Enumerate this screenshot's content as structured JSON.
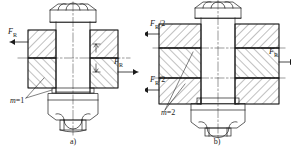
{
  "figure": {
    "type": "engineering-line-drawing",
    "background_color": "#ffffff",
    "line_color": "#1a1a1a"
  },
  "panels": [
    {
      "id": "a",
      "caption": "a)",
      "shear_planes": 2,
      "interface_label": {
        "symbol": "m",
        "equals": "=",
        "value": "1",
        "text": "m=1"
      },
      "force_labels": [
        {
          "id": "left-force",
          "symbol": "F",
          "subscript": "R",
          "text": "F_R",
          "direction": "left",
          "position": "upper-left"
        },
        {
          "id": "right-force",
          "symbol": "F",
          "subscript": "R",
          "text": "F_R",
          "direction": "right",
          "position": "middle-right"
        }
      ],
      "parts": [
        "hex-bolt-head",
        "bolt-shank",
        "upper-plate",
        "lower-plate",
        "washer",
        "hex-nut",
        "thread-end"
      ]
    },
    {
      "id": "b",
      "caption": "b)",
      "shear_planes": 3,
      "interface_label": {
        "symbol": "m",
        "equals": "=",
        "value": "2",
        "text": "m=2"
      },
      "force_labels": [
        {
          "id": "left-force-upper",
          "symbol": "F",
          "subscript": "R",
          "divisor": "/2",
          "text": "F_R/2",
          "direction": "left",
          "position": "upper-left"
        },
        {
          "id": "left-force-lower",
          "symbol": "F",
          "subscript": "R",
          "divisor": "/2",
          "text": "F_R/2",
          "direction": "left",
          "position": "lower-left"
        },
        {
          "id": "right-force",
          "symbol": "F",
          "subscript": "R",
          "text": "F_R",
          "direction": "right",
          "position": "middle-right"
        }
      ],
      "parts": [
        "hex-bolt-head",
        "bolt-shank",
        "upper-plate",
        "middle-plate",
        "lower-plate",
        "washer",
        "hex-nut",
        "thread-end"
      ]
    }
  ]
}
